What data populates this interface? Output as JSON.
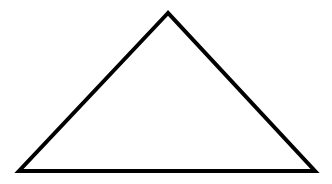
{
  "diagram": {
    "shape": "triangle",
    "background": "#ffffff",
    "stroke": "#000000",
    "stroke_width": 4,
    "fill": "#ffffff",
    "vertices": {
      "apex": [
        168,
        13
      ],
      "bottom_left": [
        19,
        171
      ],
      "bottom_right": [
        315,
        171
      ]
    }
  }
}
